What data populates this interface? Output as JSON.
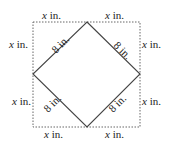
{
  "diagram": {
    "square": {
      "x1": 33,
      "y1": 22,
      "x2": 140,
      "y2": 127,
      "stroke": "#555555",
      "style": "dotted"
    },
    "diamond": {
      "stroke": "#444444"
    },
    "labels": {
      "top_left": {
        "var": "x",
        "unit": " in."
      },
      "top_right": {
        "var": "x",
        "unit": " in."
      },
      "left_top": {
        "var": "x",
        "unit": " in."
      },
      "left_bottom": {
        "var": "x",
        "unit": " in."
      },
      "right_top": {
        "var": "x",
        "unit": " in."
      },
      "right_bottom": {
        "var": "x",
        "unit": " in."
      },
      "bottom_left": {
        "var": "x",
        "unit": " in."
      },
      "bottom_right": {
        "var": "x",
        "unit": " in."
      },
      "diag_top_left": "8 in.",
      "diag_top_right": "8 in.",
      "diag_bottom_left": "8 in.",
      "diag_bottom_right": "8 in."
    }
  }
}
